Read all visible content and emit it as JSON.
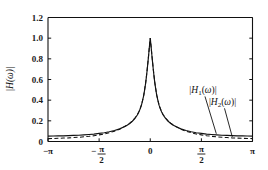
{
  "chart_data": {
    "type": "line",
    "title": "",
    "xlabel": "",
    "ylabel": "|H(ω)|",
    "xlim": [
      -3.14159,
      3.14159
    ],
    "ylim": [
      0,
      1.2
    ],
    "grid": false,
    "legend_position": "annotation-callouts",
    "xticks": [
      -3.14159,
      -1.5708,
      0,
      1.5708,
      3.14159
    ],
    "xticklabels": [
      "−π",
      "−π/2",
      "0",
      "π/2",
      "π"
    ],
    "yticks": [
      0,
      0.2,
      0.4,
      0.6,
      0.8,
      1.0,
      1.2
    ],
    "yticklabels": [
      "0",
      "0.2",
      "0.4",
      "0.6",
      "0.8",
      "1.0",
      "1.2"
    ],
    "annotations": [
      {
        "text": "|H₁(ω)|",
        "x": 1.62,
        "y": 0.47,
        "points_to_x": 2.03,
        "points_to_y": 0.075
      },
      {
        "text": "|H₂(ω)|",
        "x": 2.22,
        "y": 0.355,
        "points_to_x": 2.52,
        "points_to_y": 0.045
      }
    ],
    "series": [
      {
        "name": "|H₁(ω)|",
        "style": "solid",
        "color": "#111111",
        "x": [
          -3.14159,
          -2.98,
          -2.83,
          -2.67,
          -2.51,
          -2.36,
          -2.2,
          -2.04,
          -1.88,
          -1.73,
          -1.571,
          -1.41,
          -1.26,
          -1.1,
          -0.94,
          -0.785,
          -0.71,
          -0.63,
          -0.55,
          -0.47,
          -0.393,
          -0.35,
          -0.31,
          -0.27,
          -0.24,
          -0.2,
          -0.17,
          -0.14,
          -0.12,
          -0.095,
          -0.07,
          -0.05,
          -0.03,
          -0.015,
          0,
          0.015,
          0.03,
          0.05,
          0.07,
          0.095,
          0.12,
          0.14,
          0.17,
          0.2,
          0.24,
          0.27,
          0.31,
          0.35,
          0.393,
          0.47,
          0.55,
          0.63,
          0.71,
          0.785,
          0.94,
          1.1,
          1.26,
          1.41,
          1.571,
          1.73,
          1.88,
          2.04,
          2.2,
          2.36,
          2.51,
          2.67,
          2.83,
          2.98,
          3.14159
        ],
        "y": [
          0.052,
          0.053,
          0.054,
          0.055,
          0.057,
          0.059,
          0.061,
          0.064,
          0.068,
          0.072,
          0.078,
          0.085,
          0.094,
          0.106,
          0.122,
          0.145,
          0.158,
          0.175,
          0.196,
          0.224,
          0.259,
          0.286,
          0.316,
          0.352,
          0.39,
          0.446,
          0.505,
          0.568,
          0.62,
          0.692,
          0.77,
          0.834,
          0.904,
          0.953,
          1.0,
          0.953,
          0.904,
          0.834,
          0.77,
          0.692,
          0.62,
          0.568,
          0.505,
          0.446,
          0.39,
          0.352,
          0.316,
          0.286,
          0.259,
          0.224,
          0.196,
          0.175,
          0.158,
          0.145,
          0.122,
          0.106,
          0.094,
          0.085,
          0.078,
          0.072,
          0.068,
          0.064,
          0.061,
          0.059,
          0.057,
          0.055,
          0.054,
          0.053,
          0.052
        ]
      },
      {
        "name": "|H₂(ω)|",
        "style": "dashed",
        "color": "#111111",
        "x": [
          -3.14159,
          -2.98,
          -2.83,
          -2.67,
          -2.51,
          -2.36,
          -2.2,
          -2.04,
          -1.88,
          -1.73,
          -1.571,
          -1.41,
          -1.26,
          -1.1,
          -0.94,
          -0.785,
          -0.71,
          -0.63,
          -0.55,
          -0.47,
          -0.393,
          -0.35,
          -0.31,
          -0.27,
          -0.24,
          -0.2,
          -0.17,
          -0.14,
          -0.12,
          -0.095,
          -0.07,
          -0.05,
          -0.03,
          -0.015,
          0,
          0.015,
          0.03,
          0.05,
          0.07,
          0.095,
          0.12,
          0.14,
          0.17,
          0.2,
          0.24,
          0.27,
          0.31,
          0.35,
          0.393,
          0.47,
          0.55,
          0.63,
          0.71,
          0.785,
          0.94,
          1.1,
          1.26,
          1.41,
          1.571,
          1.73,
          1.88,
          2.04,
          2.2,
          2.36,
          2.51,
          2.67,
          2.83,
          2.98,
          3.14159
        ],
        "y": [
          0.028,
          0.029,
          0.031,
          0.033,
          0.035,
          0.038,
          0.041,
          0.045,
          0.05,
          0.056,
          0.064,
          0.073,
          0.085,
          0.1,
          0.119,
          0.145,
          0.159,
          0.177,
          0.199,
          0.227,
          0.262,
          0.289,
          0.319,
          0.355,
          0.393,
          0.449,
          0.508,
          0.571,
          0.623,
          0.695,
          0.772,
          0.836,
          0.905,
          0.954,
          1.0,
          0.954,
          0.905,
          0.836,
          0.772,
          0.695,
          0.623,
          0.571,
          0.508,
          0.449,
          0.393,
          0.355,
          0.319,
          0.289,
          0.262,
          0.227,
          0.199,
          0.177,
          0.159,
          0.145,
          0.119,
          0.1,
          0.085,
          0.073,
          0.064,
          0.056,
          0.05,
          0.045,
          0.041,
          0.038,
          0.035,
          0.033,
          0.031,
          0.029,
          0.028
        ]
      }
    ]
  },
  "colors": {
    "axis": "#111111",
    "curve": "#111111",
    "background": "#ffffff"
  }
}
